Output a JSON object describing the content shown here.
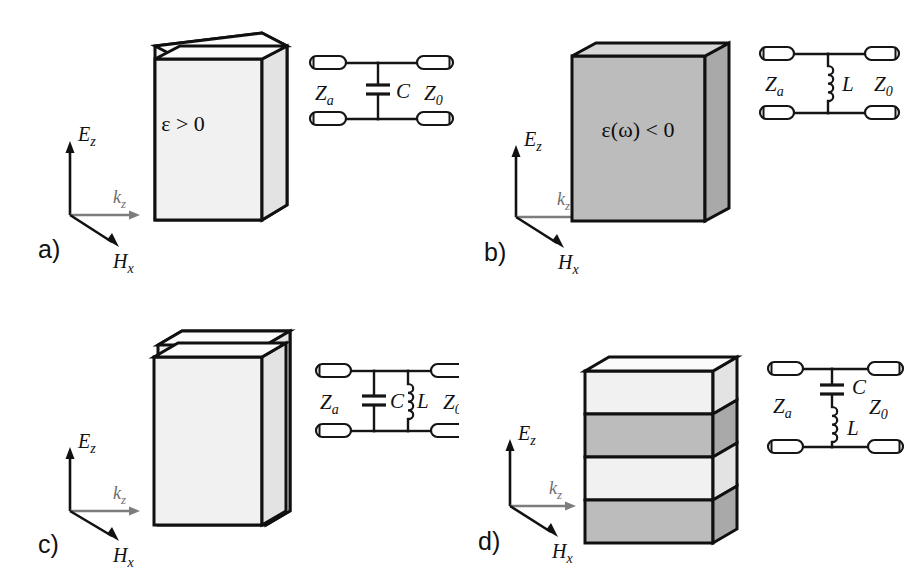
{
  "figure": {
    "type": "scientific-diagram",
    "background_color": "#ffffff",
    "line_color": "#151515"
  },
  "colors": {
    "slab_light": "#f1f1f1",
    "slab_light_top": "#fbfbfb",
    "slab_light_side": "#e3e3e3",
    "slab_gray": "#bcbcbc",
    "slab_gray_top": "#d6d6d6",
    "slab_gray_side": "#a9a9a9",
    "outline": "#101010",
    "k_arrow": "#7d7d7d",
    "field_arrow": "#111111"
  },
  "axes": {
    "e_symbol": "E",
    "e_subscript": "z",
    "k_symbol": "k",
    "k_subscript": "z",
    "h_symbol": "H",
    "h_subscript": "x"
  },
  "circuit_symbols": {
    "port_left_label": "Z",
    "port_left_subscript": "a",
    "port_right_label": "Z",
    "port_right_subscript": "0",
    "capacitor_label": "C",
    "inductor_label": "L"
  },
  "panels": [
    {
      "id": "a",
      "letter": "a)",
      "slab": {
        "kind": "single-slab",
        "fill": "slab_light",
        "layers": 1,
        "material_label": "ε > 0",
        "material_label_parts": {
          "epsilon": "ε",
          "relation": "> 0"
        }
      },
      "circuit": {
        "topology": "shunt-capacitor",
        "elements": [
          "C"
        ],
        "left_port": "Zₐ",
        "right_port": "Z₀",
        "capacitor_label": "C",
        "inductor_label": null
      }
    },
    {
      "id": "b",
      "letter": "b)",
      "slab": {
        "kind": "single-slab",
        "fill": "slab_gray",
        "layers": 1,
        "material_label": "ε(ω) < 0",
        "material_label_parts": {
          "epsilon": "ε",
          "omega": "(ω)",
          "relation": "< 0"
        }
      },
      "circuit": {
        "topology": "shunt-inductor",
        "elements": [
          "L"
        ],
        "left_port": "Zₐ",
        "right_port": "Z₀",
        "capacitor_label": null,
        "inductor_label": "L"
      }
    },
    {
      "id": "c",
      "letter": "c)",
      "slab": {
        "kind": "double-slab",
        "fill": "slab_light",
        "layers": 2,
        "material_label": "",
        "material_label_parts": {}
      },
      "circuit": {
        "topology": "parallel-LC-shunt",
        "elements": [
          "C",
          "L"
        ],
        "left_port": "Zₐ",
        "right_port": "Z₀",
        "capacitor_label": "C",
        "inductor_label": "L"
      }
    },
    {
      "id": "d",
      "letter": "d)",
      "slab": {
        "kind": "multilayer-stack",
        "fill": "alternating",
        "layers": 4,
        "layer_fills": [
          "slab_light",
          "slab_gray",
          "slab_light",
          "slab_gray"
        ],
        "material_label": "",
        "material_label_parts": {}
      },
      "circuit": {
        "topology": "series-LC-shunt",
        "elements": [
          "C",
          "L"
        ],
        "left_port": "Zₐ",
        "right_port": "Z₀",
        "capacitor_label": "C",
        "inductor_label": "L"
      }
    }
  ]
}
